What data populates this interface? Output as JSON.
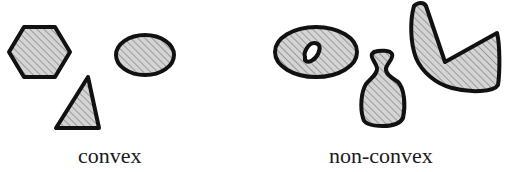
{
  "labels": {
    "convex": "convex",
    "non_convex": "non-convex"
  },
  "groups": [
    {
      "name": "convex",
      "shapes": [
        "hexagon",
        "ellipse",
        "triangle"
      ]
    },
    {
      "name": "non-convex",
      "shapes": [
        "ellipse-with-hole",
        "vase",
        "v-shape"
      ]
    }
  ],
  "colors": {
    "fill": "#d2d2d2",
    "hatch": "#9a9a9a",
    "stroke": "#111111"
  }
}
